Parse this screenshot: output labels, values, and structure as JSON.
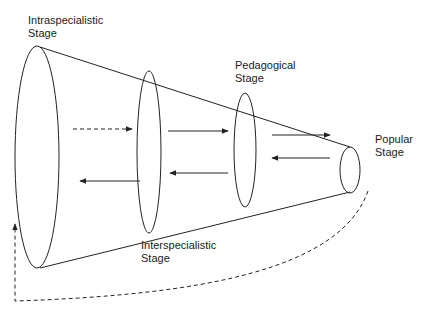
{
  "diagram": {
    "type": "cone-of-stages",
    "colors": {
      "stroke": "#222222",
      "text": "#1a1a1a",
      "background": "#ffffff"
    },
    "stages": [
      {
        "id": "intraspecialistic",
        "line1": "Intraspecialistic",
        "line2": "Stage"
      },
      {
        "id": "interspecialistic",
        "line1": "Interspecialistic",
        "line2": "Stage"
      },
      {
        "id": "pedagogical",
        "line1": "Pedagogical",
        "line2": "Stage"
      },
      {
        "id": "popular",
        "line1": "Popular",
        "line2": "Stage"
      }
    ],
    "arrows": [
      {
        "from": "intraspecialistic",
        "to": "interspecialistic",
        "style": "dashed",
        "direction": "forward"
      },
      {
        "from": "interspecialistic",
        "to": "pedagogical",
        "style": "solid",
        "direction": "forward"
      },
      {
        "from": "pedagogical",
        "to": "popular",
        "style": "solid",
        "direction": "forward"
      },
      {
        "from": "interspecialistic",
        "to": "intraspecialistic",
        "style": "solid",
        "direction": "backward"
      },
      {
        "from": "pedagogical",
        "to": "interspecialistic",
        "style": "solid",
        "direction": "backward"
      },
      {
        "from": "popular",
        "to": "pedagogical",
        "style": "solid",
        "direction": "backward"
      },
      {
        "from": "popular",
        "to": "intraspecialistic",
        "style": "dashed",
        "direction": "feedback-loop"
      }
    ]
  }
}
